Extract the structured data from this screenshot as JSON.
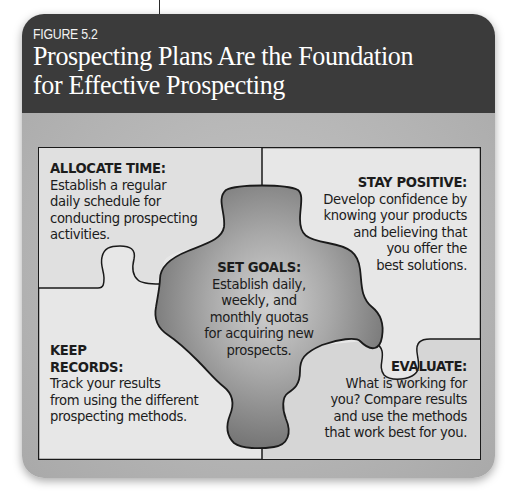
{
  "figure": {
    "label": "FIGURE 5.2",
    "title_line1": "Prospecting Plans Are the Foundation",
    "title_line2": "for Effective Prospecting"
  },
  "colors": {
    "header_bg": "#3b3b3b",
    "panel_bg": "#b5b5b5",
    "piece_bg": "#e6e6e6",
    "center_piece_light": "#c8c8c8",
    "center_piece_dark": "#6a6a6a",
    "outline": "#1a1a1a"
  },
  "diagram": {
    "type": "puzzle",
    "pieces": [
      {
        "id": "allocate-time",
        "position": "top-left",
        "heading": "ALLOCATE TIME:",
        "body": "Establish a regular daily schedule for conducting prospecting activities."
      },
      {
        "id": "stay-positive",
        "position": "top-right",
        "heading": "STAY POSITIVE:",
        "body": "Develop confidence by knowing your products and believing that you offer the best solutions."
      },
      {
        "id": "set-goals",
        "position": "center",
        "heading": "SET GOALS:",
        "body": "Establish daily, weekly, and monthly quotas for acquiring new prospects."
      },
      {
        "id": "keep-records",
        "position": "bottom-left",
        "heading": "KEEP RECORDS:",
        "body": "Track your results from using the different prospecting methods."
      },
      {
        "id": "evaluate",
        "position": "bottom-right",
        "heading": "EVALUATE:",
        "body": "What is working for you? Compare results and use the methods that work best for you."
      }
    ]
  },
  "text": {
    "tl_head": "ALLOCATE TIME:",
    "tl_l1": "Establish a regular",
    "tl_l2": "daily schedule for",
    "tl_l3": "conducting prospecting",
    "tl_l4": "activities.",
    "tr_head": "STAY POSITIVE:",
    "tr_l1": "Develop confidence by",
    "tr_l2": "knowing your products",
    "tr_l3": "and believing that",
    "tr_l4": "you offer the",
    "tr_l5": "best solutions.",
    "c_head": "SET GOALS:",
    "c_l1": "Establish daily,",
    "c_l2": "weekly, and",
    "c_l3": "monthly quotas",
    "c_l4": "for acquiring new",
    "c_l5": "prospects.",
    "bl_head1": "KEEP",
    "bl_head2": "RECORDS:",
    "bl_l1": "Track your results",
    "bl_l2": "from using the different",
    "bl_l3": "prospecting methods.",
    "br_head": "EVALUATE:",
    "br_l1": "What is working for",
    "br_l2": "you? Compare results",
    "br_l3": "and use the methods",
    "br_l4": "that work best for you."
  }
}
